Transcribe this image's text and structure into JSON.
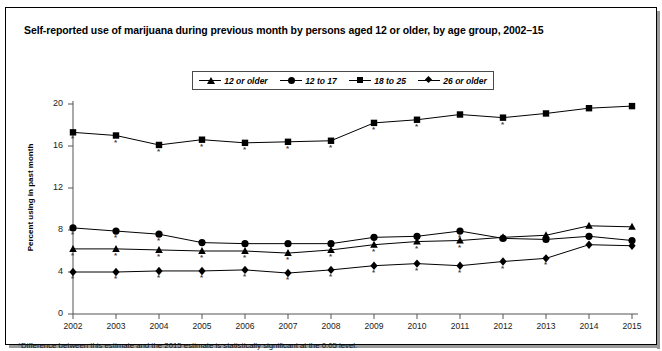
{
  "chart_data": {
    "type": "line",
    "title": "Self-reported use of marijuana during previous month by persons aged 12 or older, by age group, 2002–15",
    "xlabel": "",
    "ylabel": "Percent using in past month",
    "ylim": [
      0,
      20
    ],
    "yticks": [
      0,
      4,
      8,
      12,
      16,
      20
    ],
    "grid": false,
    "legend_position": "top-center",
    "categories": [
      "2002",
      "2003",
      "2004",
      "2005",
      "2006",
      "2007",
      "2008",
      "2009",
      "2010",
      "2011",
      "2012",
      "2013",
      "2014",
      "2015"
    ],
    "series": [
      {
        "name": "12 or older",
        "marker": "triangle",
        "values": [
          6.2,
          6.2,
          6.1,
          6.0,
          6.0,
          5.8,
          6.1,
          6.6,
          6.9,
          7.0,
          7.3,
          7.5,
          8.4,
          8.3
        ],
        "significant": [
          true,
          true,
          true,
          true,
          true,
          true,
          true,
          true,
          true,
          true,
          false,
          false,
          false,
          false
        ]
      },
      {
        "name": "12 to 17",
        "marker": "circle",
        "values": [
          8.2,
          7.9,
          7.6,
          6.8,
          6.7,
          6.7,
          6.7,
          7.3,
          7.4,
          7.9,
          7.2,
          7.1,
          7.4,
          7.0
        ],
        "significant": [
          true,
          true,
          true,
          false,
          false,
          false,
          false,
          false,
          false,
          true,
          false,
          false,
          false,
          false
        ]
      },
      {
        "name": "18 to 25",
        "marker": "square",
        "values": [
          17.3,
          17.0,
          16.1,
          16.6,
          16.3,
          16.4,
          16.5,
          18.2,
          18.5,
          19.0,
          18.7,
          19.1,
          19.6,
          19.8
        ],
        "significant": [
          true,
          true,
          true,
          true,
          true,
          true,
          true,
          true,
          true,
          false,
          true,
          false,
          false,
          false
        ]
      },
      {
        "name": "26 or older",
        "marker": "diamond",
        "values": [
          4.0,
          4.0,
          4.1,
          4.1,
          4.2,
          3.9,
          4.2,
          4.6,
          4.8,
          4.6,
          5.0,
          5.3,
          6.6,
          6.5
        ],
        "significant": [
          true,
          true,
          true,
          true,
          true,
          true,
          true,
          true,
          true,
          true,
          true,
          true,
          false,
          false
        ]
      }
    ]
  },
  "legend": {
    "items": [
      {
        "label": "12 or older",
        "marker": "triangle"
      },
      {
        "label": "12 to 17",
        "marker": "circle"
      },
      {
        "label": "18 to 25",
        "marker": "square"
      },
      {
        "label": "26 or older",
        "marker": "diamond"
      }
    ]
  },
  "footnote": "*Difference between this estimate and the 2015 estimate is statistically significant at the 0.05 level."
}
